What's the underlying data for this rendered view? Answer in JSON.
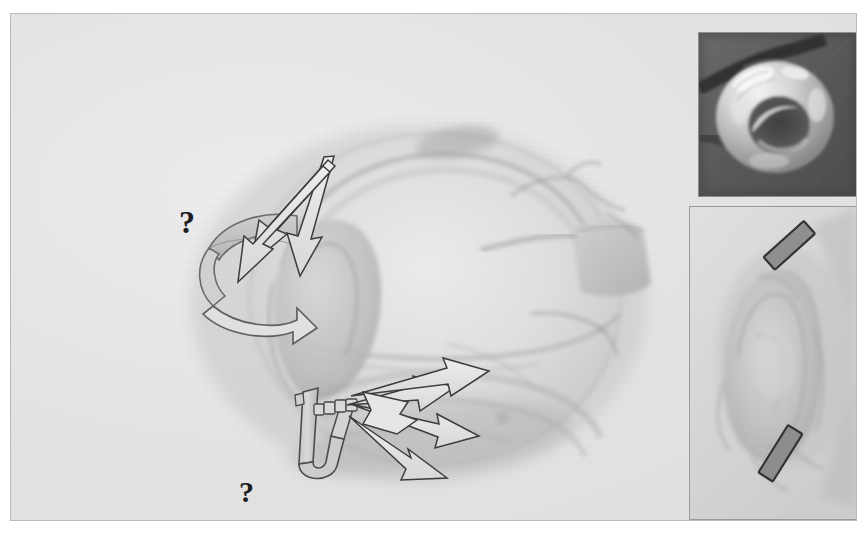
{
  "figure": {
    "kind": "surgical-illustration",
    "cut_off_header_text": "",
    "background_color": "#e9e9e9",
    "frame_border_color": "#b9b9b9",
    "ink_color": "#3f3f3f",
    "arrow_fill": "#d9d9d9",
    "annotations": {
      "top_question_mark": "?",
      "bottom_question_mark": "?"
    }
  },
  "main_illustration": {
    "name": "heart-valve-anatomy-drawing",
    "description": "Pale grayscale anatomical rendering of a heart with great vessel and valve leaflet region",
    "tone_light": "#dcdcdc",
    "tone_mid": "#c4c4c4",
    "tone_dark": "#a8a8a8"
  },
  "overlays": {
    "rotation_arrow": {
      "name": "curved-rotation-arrow",
      "label": "?",
      "fill": "#c9c9c9",
      "stroke": "#5a5a5a"
    },
    "upper_arrow_cluster": {
      "name": "converging-arrows-upper",
      "count": 3,
      "direction": "down-left",
      "fill": "#e2e2e2",
      "stroke": "#3c3c3c"
    },
    "clip_device": {
      "name": "u-shaped-clip-device",
      "label": "?",
      "bead_count": 4,
      "fill": "#c6c6c6",
      "stroke": "#4a4a4a"
    },
    "lower_arrow_cluster": {
      "name": "radiating-arrows-lower",
      "count": 4,
      "direction": "right",
      "fill": "#e4e4e4",
      "stroke": "#3c3c3c"
    }
  },
  "photo_inset": {
    "name": "prosthetic-ring-photograph",
    "description": "Close-up photograph of a translucent annular ring device on dark background",
    "background_color": "#5a5a5a",
    "border_color": "#8e8e8e"
  },
  "detail_inset": {
    "name": "valve-detail-closeup",
    "description": "Magnified grayscale view of the valve leaflet region",
    "background_color": "#d9d9d9",
    "border_color": "#9a9a9a",
    "markers": [
      {
        "name": "bar-marker-upper",
        "angle_deg": -42,
        "fill": "#8f8f8f",
        "stroke": "#3a3a3a"
      },
      {
        "name": "bar-marker-lower",
        "angle_deg": -58,
        "fill": "#8d8d8d",
        "stroke": "#3a3a3a"
      }
    ]
  }
}
